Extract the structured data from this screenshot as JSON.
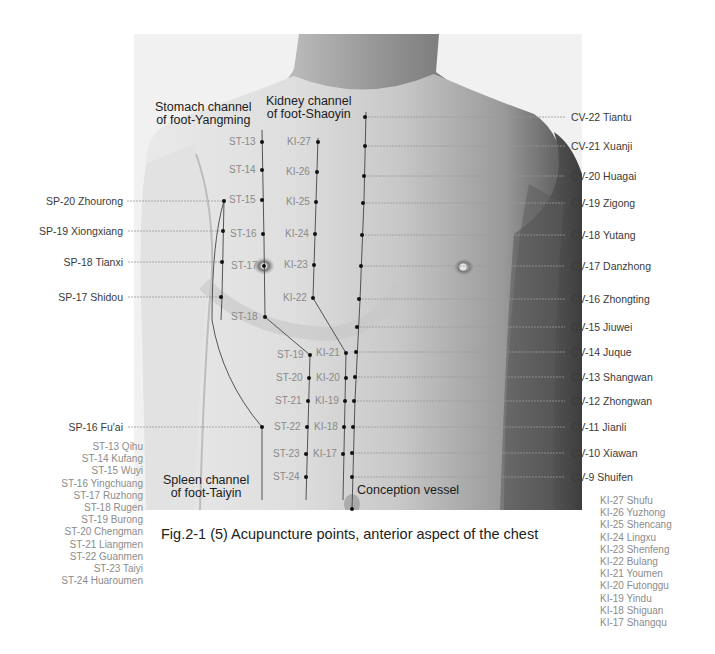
{
  "figure": {
    "caption": "Fig.2-1 (5) Acupuncture points, anterior aspect of the chest",
    "channels": {
      "stomach": [
        "Stomach channel",
        "of foot-Yangming"
      ],
      "kidney": [
        "Kidney channel",
        "of foot-Shaoyin"
      ],
      "spleen": [
        "Spleen channel",
        "of foot-Taiyin"
      ],
      "conception": "Conception vessel"
    },
    "colors": {
      "point": "#111111",
      "leader_line": "#9a9a9a",
      "label": "#3a3a3a",
      "legend_text": "#8c8c8c"
    }
  },
  "cv_points": [
    {
      "label": "CV-22 Tiantu",
      "y": 117
    },
    {
      "label": "CV-21 Xuanji",
      "y": 146
    },
    {
      "label": "CV-20 Huagai",
      "y": 176
    },
    {
      "label": "CV-19 Zigong",
      "y": 203
    },
    {
      "label": "CV-18 Yutang",
      "y": 235
    },
    {
      "label": "CV-17 Danzhong",
      "y": 266
    },
    {
      "label": "CV-16 Zhongting",
      "y": 299
    },
    {
      "label": "CV-15 Jiuwei",
      "y": 327
    },
    {
      "label": "CV-14 Juque",
      "y": 352
    },
    {
      "label": "CV-13 Shangwan",
      "y": 377
    },
    {
      "label": "CV-12 Zhongwan",
      "y": 401
    },
    {
      "label": "CV-11 Jianli",
      "y": 427
    },
    {
      "label": "CV-10 Xiawan",
      "y": 453
    },
    {
      "label": "CV-9 Shuifen",
      "y": 477
    }
  ],
  "sp_points": [
    {
      "label": "SP-20 Zhourong",
      "y": 201
    },
    {
      "label": "SP-19 Xiongxiang",
      "y": 231
    },
    {
      "label": "SP-18 Tianxi",
      "y": 262
    },
    {
      "label": "SP-17 Shidou",
      "y": 297
    },
    {
      "label": "SP-16 Fu'ai",
      "y": 427
    }
  ],
  "st_markers": [
    {
      "label": "ST-13",
      "x": 262,
      "y": 142
    },
    {
      "label": "ST-14",
      "x": 262,
      "y": 170
    },
    {
      "label": "ST-15",
      "x": 262,
      "y": 200
    },
    {
      "label": "ST-16",
      "x": 263,
      "y": 234
    },
    {
      "label": "ST-17",
      "x": 264,
      "y": 266
    },
    {
      "label": "ST-18",
      "x": 265,
      "y": 317
    },
    {
      "label": "ST-19",
      "x": 310,
      "y": 355
    },
    {
      "label": "ST-20",
      "x": 309,
      "y": 378
    },
    {
      "label": "ST-21",
      "x": 308,
      "y": 401
    },
    {
      "label": "ST-22",
      "x": 307,
      "y": 427
    },
    {
      "label": "ST-23",
      "x": 306,
      "y": 454
    },
    {
      "label": "ST-24",
      "x": 306,
      "y": 477
    }
  ],
  "ki_markers": [
    {
      "label": "KI-27",
      "x": 318,
      "y": 142
    },
    {
      "label": "KI-26",
      "x": 317,
      "y": 172
    },
    {
      "label": "KI-25",
      "x": 316,
      "y": 202
    },
    {
      "label": "KI-24",
      "x": 315,
      "y": 234
    },
    {
      "label": "KI-23",
      "x": 314,
      "y": 265
    },
    {
      "label": "KI-22",
      "x": 313,
      "y": 298
    },
    {
      "label": "KI-21",
      "x": 346,
      "y": 353
    },
    {
      "label": "KI-20",
      "x": 346,
      "y": 378
    },
    {
      "label": "KI-19",
      "x": 345,
      "y": 401
    },
    {
      "label": "KI-18",
      "x": 344,
      "y": 427
    },
    {
      "label": "KI-17",
      "x": 343,
      "y": 454
    }
  ],
  "st_legend": [
    "ST-13 Qihu",
    "ST-14 Kufang",
    "ST-15 Wuyi",
    "ST-16 Yingchuang",
    "ST-17 Ruzhong",
    "ST-18 Rugen",
    "ST-19 Burong",
    "ST-20 Chengman",
    "ST-21 Liangmen",
    "ST-22 Guanmen",
    "ST-23 Taiyi",
    "ST-24 Huaroumen"
  ],
  "ki_legend": [
    "KI-27 Shufu",
    "KI-26 Yuzhong",
    "KI-25 Shencang",
    "KI-24 Lingxu",
    "KI-23 Shenfeng",
    "KI-22 Bulang",
    "KI-21 Youmen",
    "KI-20 Futonggu",
    "KI-19 Yindu",
    "KI-18 Shiguan",
    "KI-17 Shangqu"
  ]
}
